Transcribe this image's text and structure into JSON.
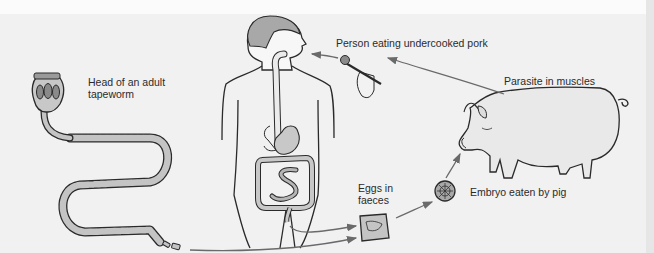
{
  "diagram": {
    "labels": {
      "tapeworm_head": "Head of an adult tapeworm",
      "tapeworm_head_line1": "Head of an adult",
      "tapeworm_head_line2": "tapeworm",
      "person_eating": "Person eating undercooked pork",
      "parasite_muscles": "Parasite in muscles",
      "eggs_line1": "Eggs in",
      "eggs_line2": "faeces",
      "embryo": "Embryo eaten by pig"
    },
    "stages": [
      {
        "id": "adult-tapeworm",
        "label": "Head of an adult tapeworm"
      },
      {
        "id": "eggs",
        "label": "Eggs in faeces"
      },
      {
        "id": "embryo",
        "label": "Embryo eaten by pig"
      },
      {
        "id": "pig",
        "label": "Parasite in muscles"
      },
      {
        "id": "human",
        "label": "Person eating undercooked pork"
      }
    ],
    "flow": [
      "adult-tapeworm -> eggs",
      "human -> eggs",
      "eggs -> embryo",
      "embryo -> pig",
      "pig -> human"
    ],
    "colors": {
      "background": "#f1f1f1",
      "outline": "#2a2a2a",
      "fill_gray": "#bdbdbd",
      "body_fill": "#f3f3f3",
      "arrow": "#6a6a6a",
      "pig_fill": "#e8e8e8"
    }
  }
}
